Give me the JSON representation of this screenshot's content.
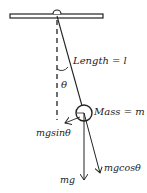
{
  "diagram": {
    "type": "simple-pendulum-force-diagram",
    "labels": {
      "length": "Length = l",
      "angle": "θ",
      "mass": "Mass = m",
      "tangential_force": "mgsinθ",
      "weight": "mg",
      "radial_force": "mgcosθ"
    },
    "colors": {
      "stroke": "#222222",
      "ceiling_fill": "#ffffff",
      "background": "#ffffff"
    }
  }
}
